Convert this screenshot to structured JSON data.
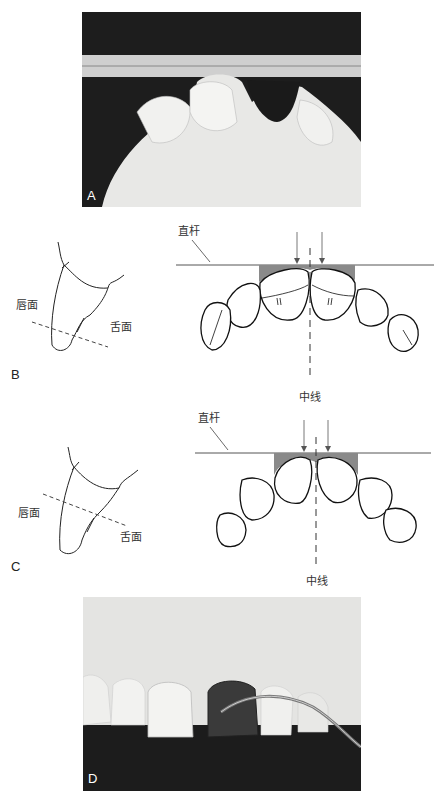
{
  "figure": {
    "panels": [
      {
        "id": "A",
        "letter": "A",
        "type": "photo",
        "description": "occlusal view of maxillary cast with straight bar and dark restoration"
      },
      {
        "id": "B",
        "letter": "B",
        "type": "line-drawing",
        "labels": {
          "labial": "唇面",
          "lingual": "舌面",
          "straight_bar": "直杆",
          "midline": "中线"
        }
      },
      {
        "id": "C",
        "letter": "C",
        "type": "line-drawing",
        "labels": {
          "labial": "唇面",
          "lingual": "舌面",
          "straight_bar": "直杆",
          "midline": "中线"
        }
      },
      {
        "id": "D",
        "letter": "D",
        "type": "photo",
        "description": "labial view of cast with dark crown and curved instrument"
      }
    ]
  },
  "colors": {
    "line": "#222222",
    "shade": "#8a8a8a",
    "bar": "#555555",
    "photo_dark": "#1c1c1c",
    "photo_light": "#e6e6e4"
  }
}
